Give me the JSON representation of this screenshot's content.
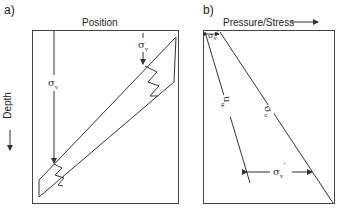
{
  "panel_a": {
    "label": "a)",
    "x_axis_label": "Position",
    "y_axis_label": "Depth",
    "stress_label_long": "σ",
    "stress_label_long_sub": "v",
    "stress_label_short": "σ",
    "stress_label_short_sub": "v"
  },
  "panel_b": {
    "label": "b)",
    "x_axis_label": "Pressure/Stress",
    "top_label": "σ",
    "top_label_sub": "v",
    "top_label_prime": "′",
    "pore_pressure_label": "u",
    "pore_pressure_sub": "w",
    "total_stress_label": "σ",
    "total_stress_sub": "v",
    "effective_stress_label": "σ",
    "effective_stress_sub": "v",
    "effective_stress_prime": "′"
  },
  "colors": {
    "line": "#333333",
    "frame": "#444444"
  }
}
